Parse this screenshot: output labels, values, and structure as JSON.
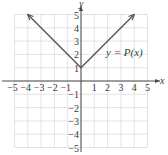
{
  "chart_data": {
    "type": "line",
    "title": "",
    "function_label": "y = P(x)",
    "xlabel": "x",
    "ylabel": "y",
    "xlim": [
      -5,
      5
    ],
    "ylim": [
      -5,
      5
    ],
    "grid": true,
    "x_ticks": [
      "−5",
      "−4",
      "−3",
      "−2",
      "−1",
      "1",
      "2",
      "3",
      "4",
      "5"
    ],
    "y_ticks": [
      "5",
      "4",
      "3",
      "2",
      "1",
      "−1",
      "−2",
      "−3",
      "−4",
      "−5"
    ],
    "series": [
      {
        "name": "y = P(x)",
        "x": [
          -4,
          0,
          4
        ],
        "y": [
          5,
          1,
          5
        ],
        "arrows_at_ends": true
      }
    ]
  },
  "colors": {
    "grid": "#dcdcdc",
    "axis": "#4a4a4a",
    "curve": "#555555",
    "text": "#3a3a3a"
  }
}
